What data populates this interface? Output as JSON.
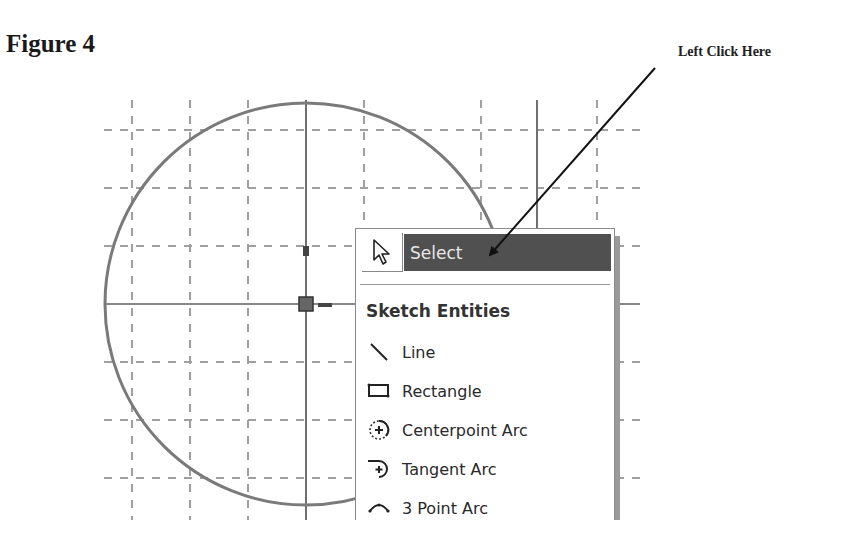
{
  "figure": {
    "title": "Figure 4",
    "callout": "Left Click Here"
  },
  "sketch": {
    "grid_color": "#9a9a9a",
    "circle_color": "#7a7a7a",
    "axis_color": "#666666",
    "circle": {
      "cx": 306,
      "cy": 304,
      "r": 201
    }
  },
  "context_menu": {
    "select": {
      "label": "Select",
      "highlight_color": "#505050",
      "icon": "arrow-cursor-icon"
    },
    "group_heading": "Sketch Entities",
    "items": [
      {
        "label": "Line",
        "icon": "line-icon"
      },
      {
        "label": "Rectangle",
        "icon": "rectangle-icon"
      },
      {
        "label": "Centerpoint Arc",
        "icon": "centerpoint-arc-icon"
      },
      {
        "label": "Tangent Arc",
        "icon": "tangent-arc-icon"
      },
      {
        "label": "3 Point Arc",
        "icon": "three-point-arc-icon"
      }
    ]
  }
}
